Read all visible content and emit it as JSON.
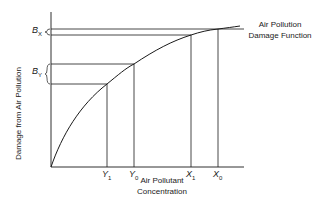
{
  "diagram": {
    "title": "Air Pollution Damage Function",
    "curve_label_line1": "Air Pollution",
    "curve_label_line2": "Damage Function",
    "y_axis_label": "Damage from Air Pollution",
    "x_axis_label_line1": "Air Pollutant",
    "x_axis_label_line2": "Concentration",
    "x_ticks": [
      {
        "main": "Y",
        "sub": "1"
      },
      {
        "main": "Y",
        "sub": "0"
      },
      {
        "main": "X",
        "sub": "1"
      },
      {
        "main": "X",
        "sub": "0"
      }
    ],
    "y_brackets": [
      {
        "main": "B",
        "sub": "X"
      },
      {
        "main": "B",
        "sub": "Y"
      }
    ],
    "colors": {
      "line": "#1a1a1a",
      "background": "#ffffff"
    }
  }
}
